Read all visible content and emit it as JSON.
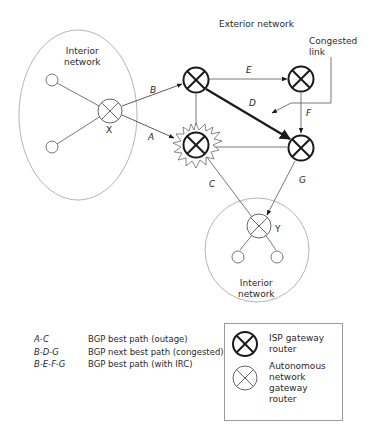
{
  "labels": {
    "exterior_network": "Exterior network",
    "congested_link": "Congested\nlink",
    "interior_network_left": "Interior\nnetwork",
    "interior_network_bottom": "Interior\nnetwork",
    "router_x": "X",
    "router_y": "Y"
  },
  "links": {
    "A": "A",
    "B": "B",
    "C": "C",
    "D": "D",
    "E": "E",
    "F": "F",
    "G": "G"
  },
  "paths": [
    {
      "code": "A-C",
      "description": "BGP best path (outage)"
    },
    {
      "code": "B-D-G",
      "description": "BGP next best path (congested)"
    },
    {
      "code": "B-E-F-G",
      "description": "BGP best path (with IRC)"
    }
  ],
  "legend": {
    "isp_router": "ISP gateway\nrouter",
    "autonomous_router": "Autonomous\nnetwork\ngateway\nrouter"
  },
  "colors": {
    "stroke": "#1a1a1a",
    "thin_stroke": "#555555",
    "ellipse": "#b5b5b5"
  }
}
